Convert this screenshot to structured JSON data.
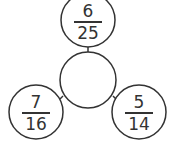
{
  "diagram": {
    "type": "fraction-circle-puzzle",
    "center": {
      "value": ""
    },
    "nodes": [
      {
        "position": "top",
        "numerator": "6",
        "denominator": "25"
      },
      {
        "position": "bottom-left",
        "numerator": "7",
        "denominator": "16"
      },
      {
        "position": "bottom-right",
        "numerator": "5",
        "denominator": "14"
      }
    ],
    "colors": {
      "stroke": "#333333",
      "background": "#ffffff"
    }
  }
}
